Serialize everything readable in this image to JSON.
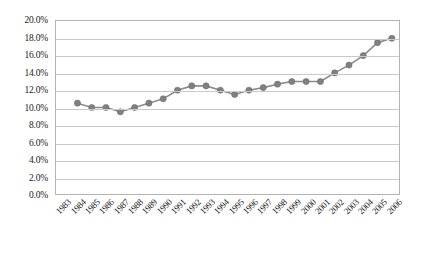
{
  "chart_data": {
    "type": "line",
    "title": "",
    "xlabel": "",
    "ylabel": "",
    "categories": [
      "1983",
      "1984",
      "1985",
      "1986",
      "1987",
      "1988",
      "1989",
      "1990",
      "1991",
      "1992",
      "1993",
      "1994",
      "1995",
      "1996",
      "1997",
      "1998",
      "1999",
      "2000",
      "2001",
      "2002",
      "2003",
      "2004",
      "2005",
      "2006"
    ],
    "values": [
      null,
      10.5,
      10.0,
      10.0,
      9.5,
      10.0,
      10.5,
      11.0,
      12.0,
      12.5,
      12.5,
      12.0,
      11.5,
      12.0,
      12.3,
      12.7,
      13.0,
      13.0,
      13.0,
      14.0,
      14.9,
      16.0,
      17.5,
      18.0
    ],
    "series": [
      {
        "name": "series-1",
        "values": [
          null,
          10.5,
          10.0,
          10.0,
          9.5,
          10.0,
          10.5,
          11.0,
          12.0,
          12.5,
          12.5,
          12.0,
          11.5,
          12.0,
          12.3,
          12.7,
          13.0,
          13.0,
          13.0,
          14.0,
          14.9,
          16.0,
          17.5,
          18.0
        ]
      }
    ],
    "y_tick_labels": [
      "0.0%",
      "2.0%",
      "4.0%",
      "6.0%",
      "8.0%",
      "10.0%",
      "12.0%",
      "14.0%",
      "16.0%",
      "18.0%",
      "20.0%"
    ],
    "y_tick_values": [
      0,
      2,
      4,
      6,
      8,
      10,
      12,
      14,
      16,
      18,
      20
    ],
    "ylim": [
      0,
      20
    ],
    "y_tick_step": 2,
    "grid": true,
    "legend": false,
    "legend_position": "none",
    "colors": {
      "line": "#8c8c8c",
      "marker": "#808080",
      "gridline": "#c9c9c9",
      "plot_border": "#b3b3b3",
      "text": "#1a1a1a",
      "background": "#ffffff"
    }
  }
}
